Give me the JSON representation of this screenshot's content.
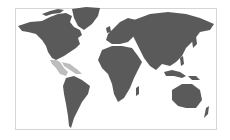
{
  "map": {
    "type": "world-map",
    "projection": "Miller-like",
    "land_color": "#5a5a5a",
    "highlight_color": "#bdbdbd",
    "ocean_color": "#ffffff",
    "frame_border_color": "#d6d6d6",
    "highlighted_regions": [
      "Central America",
      "Caribbean"
    ]
  }
}
